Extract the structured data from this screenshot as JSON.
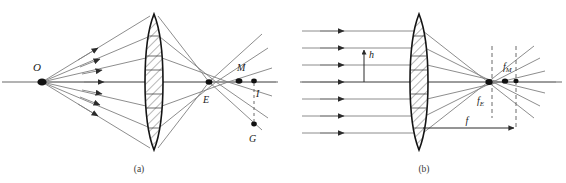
{
  "figure": {
    "background_color": "#ffffff",
    "ray_color": "#808080",
    "outline_color": "#1a1a1a",
    "label_color": "#1a1a1a",
    "dash_color": "#6b6b6b"
  },
  "panel_a": {
    "caption": "(a)",
    "description": "Point object O on axis; rays refract through lens and cross axis at different points",
    "labels": {
      "object": "O",
      "marginal_focus": "M",
      "edge_focus": "E",
      "image_point": "I",
      "ground_point": "G"
    },
    "ray_count": 7,
    "arrowheads": 6,
    "axis_y": 82
  },
  "panel_b": {
    "caption": "(b)",
    "description": "Parallel incident rays at height h converge to f_E and f_M on axis; focal length f marked",
    "labels": {
      "height": "h",
      "focal_length": "f",
      "marginal_focus": "f",
      "marginal_focus_sub": "M",
      "edge_focus": "f",
      "edge_focus_sub": "E"
    },
    "ray_count": 7,
    "arrowheads": 7,
    "axis_y": 82
  }
}
